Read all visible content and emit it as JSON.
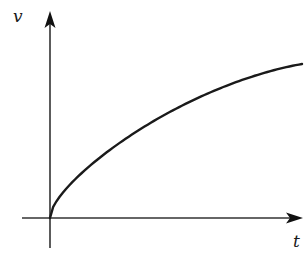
{
  "chart_data": {
    "type": "line",
    "title": "",
    "xlabel": "t",
    "ylabel": "v",
    "series": [
      {
        "name": "v(t)",
        "shape": "concave-down increasing, starting at origin (sqrt-like)",
        "x": [
          0,
          0.05,
          0.1,
          0.2,
          0.3,
          0.4,
          0.5,
          0.6,
          0.7,
          0.8,
          0.9,
          1.0
        ],
        "values": [
          0,
          0.28,
          0.38,
          0.52,
          0.62,
          0.7,
          0.77,
          0.83,
          0.88,
          0.92,
          0.96,
          1.0
        ]
      }
    ],
    "xlim": [
      0,
      1
    ],
    "ylim": [
      0,
      1.3
    ],
    "grid": false,
    "legend": null,
    "ticks": {
      "x": [],
      "y": []
    },
    "color": "#1a1a1a"
  },
  "labels": {
    "y_axis": "v",
    "x_axis": "t"
  }
}
